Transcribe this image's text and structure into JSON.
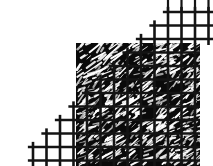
{
  "figure": {
    "label": "FIG. 13",
    "caption_number": "13",
    "caption_prefix": "FIG.",
    "type": "patent-line-drawing",
    "width": 213,
    "height": 166,
    "background_color": "#ffffff"
  },
  "drawing": {
    "title": "Mesh screen over fibrous substrate",
    "elements": [
      {
        "name": "mesh-grid",
        "description": "Open woven wire mesh / screen drawn as orthogonal grid of thick black lines with a stair-stepped upper-left edge",
        "color": "#141414",
        "line_width": 2.6,
        "cell_size": 13.5,
        "origin_x": 33,
        "origin_y": 12
      },
      {
        "name": "fibrous-substrate",
        "description": "Dark filled region with white diagonal dash texture representing randomly oriented fibers",
        "fill_color": "#0a0a0a",
        "fiber_color": "#ffffff",
        "bounds": {
          "x": 76,
          "y": 43,
          "width": 124,
          "height": 123
        }
      }
    ],
    "mesh_columns": 13,
    "mesh_rows": 12,
    "fiber_count": 520
  },
  "colors": {
    "ink": "#141414",
    "fill": "#0a0a0a",
    "paper": "#ffffff",
    "fiber": "#ffffff"
  }
}
